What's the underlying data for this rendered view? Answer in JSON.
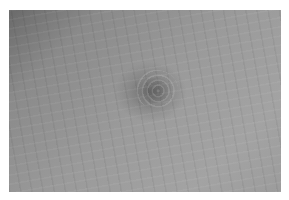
{
  "image": {
    "subject": "close-up of skin surface with a dark circular lesion",
    "palette": {
      "background": "#ffffff",
      "skin_dark_corner": "#6a6a6a",
      "skin_mid": "#9a9a9a",
      "lesion": "#5a5a5a"
    }
  }
}
